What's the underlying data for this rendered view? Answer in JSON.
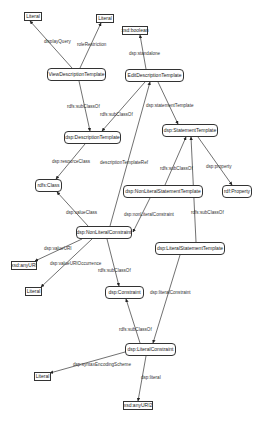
{
  "diagram": {
    "nodes": [
      {
        "id": "literal1",
        "label": "Literal",
        "kind": "literal",
        "x": 24,
        "y": 12,
        "w": 18,
        "h": 9
      },
      {
        "id": "literal2",
        "label": "Literal",
        "kind": "literal",
        "x": 96,
        "y": 14,
        "w": 18,
        "h": 9
      },
      {
        "id": "xsdBoolean",
        "label": "xsd:boolean",
        "kind": "literal",
        "x": 122,
        "y": 26,
        "w": 26,
        "h": 9
      },
      {
        "id": "viewDescTemplate",
        "label": "ViewDescriptionTemplate",
        "kind": "class",
        "x": 47,
        "y": 68,
        "w": 59,
        "h": 13
      },
      {
        "id": "editDescTemplate",
        "label": "EditDescriptionTemplate",
        "kind": "class",
        "x": 125,
        "y": 69,
        "w": 59,
        "h": 13
      },
      {
        "id": "descTemplate",
        "label": "dsp:DescriptionTemplate",
        "kind": "class",
        "x": 64,
        "y": 131,
        "w": 57,
        "h": 13
      },
      {
        "id": "statementTemplate",
        "label": "dsp:StatementTemplate",
        "kind": "class",
        "x": 162,
        "y": 124,
        "w": 56,
        "h": 13
      },
      {
        "id": "rdfsClass",
        "label": "rdfs:Class",
        "kind": "class",
        "x": 35,
        "y": 179,
        "w": 27,
        "h": 13
      },
      {
        "id": "nonLitStmtTemplate",
        "label": "dsp:NonLiteralStatementTemplate",
        "kind": "class",
        "x": 123,
        "y": 185,
        "w": 80,
        "h": 13
      },
      {
        "id": "rdfProperty",
        "label": "rdf:Property",
        "kind": "class",
        "x": 222,
        "y": 185,
        "w": 30,
        "h": 13
      },
      {
        "id": "nonLitConstraint",
        "label": "dsp:NonLiteralConstraint",
        "kind": "class",
        "x": 76,
        "y": 226,
        "w": 56,
        "h": 13
      },
      {
        "id": "litStmtTemplate",
        "label": "dsp:LiteralStatementTemplate",
        "kind": "class",
        "x": 155,
        "y": 242,
        "w": 70,
        "h": 13
      },
      {
        "id": "xsdAnyURI1",
        "label": "xsd:anyURI",
        "kind": "literal",
        "x": 11,
        "y": 261,
        "w": 26,
        "h": 9
      },
      {
        "id": "literal3",
        "label": "Literal",
        "kind": "literal",
        "x": 25,
        "y": 287,
        "w": 17,
        "h": 9
      },
      {
        "id": "constraint",
        "label": "dsp:Constraint",
        "kind": "class",
        "x": 105,
        "y": 286,
        "w": 39,
        "h": 13
      },
      {
        "id": "litConstraint",
        "label": "dsp:LiteralConstraint",
        "kind": "class",
        "x": 125,
        "y": 343,
        "w": 51,
        "h": 13
      },
      {
        "id": "literal4",
        "label": "Literal",
        "kind": "literal",
        "x": 34,
        "y": 372,
        "w": 17,
        "h": 9
      },
      {
        "id": "xsdAnyURI2",
        "label": "xsd:anyURI2",
        "kind": "literal",
        "x": 123,
        "y": 401,
        "w": 30,
        "h": 9
      }
    ],
    "edges": [
      {
        "from": "viewDescTemplate",
        "to": "literal1",
        "label": "displayQuery",
        "x1": 72,
        "y1": 68,
        "x2": 30,
        "y2": 21,
        "lx": 44,
        "ly": 39
      },
      {
        "from": "viewDescTemplate",
        "to": "literal2",
        "label": "roleRestriction",
        "x1": 80,
        "y1": 68,
        "x2": 101,
        "y2": 23,
        "lx": 77,
        "ly": 42
      },
      {
        "from": "editDescTemplate",
        "to": "xsdBoolean",
        "label": "dsp:standalone",
        "x1": 146,
        "y1": 69,
        "x2": 140,
        "y2": 35,
        "lx": 129,
        "ly": 51
      },
      {
        "from": "viewDescTemplate",
        "to": "descTemplate",
        "label": "rdfs:subClassOf",
        "x1": 79,
        "y1": 81,
        "x2": 90,
        "y2": 131,
        "lx": 67,
        "ly": 104
      },
      {
        "from": "editDescTemplate",
        "to": "descTemplate",
        "label": "rdfs:subClassOf",
        "x1": 145,
        "y1": 82,
        "x2": 102,
        "y2": 131,
        "lx": 100,
        "ly": 112
      },
      {
        "from": "editDescTemplate",
        "to": "statementTemplate",
        "label": "dsp:statementTemplate",
        "x1": 158,
        "y1": 82,
        "x2": 178,
        "y2": 124,
        "lx": 146,
        "ly": 103
      },
      {
        "from": "descTemplate",
        "to": "rdfsClass",
        "label": "dsp:resourceClass",
        "x1": 85,
        "y1": 144,
        "x2": 56,
        "y2": 179,
        "lx": 52,
        "ly": 159
      },
      {
        "from": "nonLitConstraint",
        "to": "editDescTemplate",
        "label": "descriptionTemplateRef",
        "x1": 110,
        "y1": 226,
        "x2": 150,
        "y2": 82,
        "lx": 100,
        "ly": 160
      },
      {
        "from": "nonLitStmtTemplate",
        "to": "statementTemplate",
        "label": "rdfs:subClassOf",
        "x1": 165,
        "y1": 185,
        "x2": 186,
        "y2": 137,
        "lx": 160,
        "ly": 166
      },
      {
        "from": "statementTemplate",
        "to": "rdfProperty",
        "label": "dsp:property",
        "x1": 198,
        "y1": 137,
        "x2": 232,
        "y2": 185,
        "lx": 206,
        "ly": 164
      },
      {
        "from": "litStmtTemplate",
        "to": "statementTemplate",
        "label": "rdfs:subClassOf",
        "x1": 196,
        "y1": 242,
        "x2": 191,
        "y2": 137,
        "lx": 191,
        "ly": 210
      },
      {
        "from": "nonLitConstraint",
        "to": "rdfsClass",
        "label": "dsp:valueClass",
        "x1": 88,
        "y1": 226,
        "x2": 57,
        "y2": 192,
        "lx": 66,
        "ly": 210
      },
      {
        "from": "nonLitStmtTemplate",
        "to": "nonLitConstraint",
        "label": "dsp:nonLiteralConstraint",
        "x1": 150,
        "y1": 198,
        "x2": 133,
        "y2": 232,
        "lx": 124,
        "ly": 212
      },
      {
        "from": "nonLitConstraint",
        "to": "xsdAnyURI1",
        "label": "dsp:valueURI",
        "x1": 82,
        "y1": 239,
        "x2": 35,
        "y2": 261,
        "lx": 44,
        "ly": 246
      },
      {
        "from": "nonLitConstraint",
        "to": "literal3",
        "label": "dsp:valueURIOccurrence",
        "x1": 92,
        "y1": 239,
        "x2": 41,
        "y2": 287,
        "lx": 50,
        "ly": 261
      },
      {
        "from": "nonLitConstraint",
        "to": "constraint",
        "label": "rdfs:subClassOf",
        "x1": 107,
        "y1": 239,
        "x2": 119,
        "y2": 286,
        "lx": 98,
        "ly": 268
      },
      {
        "from": "litStmtTemplate",
        "to": "litConstraint",
        "label": "dsp:literalConstraint",
        "x1": 180,
        "y1": 255,
        "x2": 153,
        "y2": 343,
        "lx": 150,
        "ly": 290
      },
      {
        "from": "litConstraint",
        "to": "constraint",
        "label": "rdfs:subClassOf",
        "x1": 140,
        "y1": 343,
        "x2": 126,
        "y2": 299,
        "lx": 119,
        "ly": 327
      },
      {
        "from": "litConstraint",
        "to": "literal4",
        "label": "dsp:syntaxEncodingScheme",
        "x1": 125,
        "y1": 352,
        "x2": 50,
        "y2": 373,
        "lx": 73,
        "ly": 362
      },
      {
        "from": "litConstraint",
        "to": "xsdAnyURI2",
        "label": "dsp:literal",
        "x1": 146,
        "y1": 356,
        "x2": 138,
        "y2": 401,
        "lx": 141,
        "ly": 375
      }
    ]
  },
  "labels": {
    "literal1": "Literal",
    "literal2": "Literal",
    "xsdBoolean": "xsd:boolean",
    "viewDescTemplate": "ViewDescriptionTemplate",
    "editDescTemplate": "EditDescriptionTemplate",
    "descTemplate": "dsp:DescriptionTemplate",
    "statementTemplate": "dsp:StatementTemplate",
    "rdfsClass": "rdfs:Class",
    "nonLitStmtTemplate": "dsp:NonLiteralStatementTemplate",
    "rdfProperty": "rdf:Property",
    "nonLitConstraint": "dsp:NonLiteralConstraint",
    "litStmtTemplate": "dsp:LiteralStatementTemplate",
    "xsdAnyURI1": "xsd:anyURI",
    "literal3": "Literal",
    "constraint": "dsp:Constraint",
    "litConstraint": "dsp:LiteralConstraint",
    "literal4": "Literal",
    "xsdAnyURI2": "xsd:anyURI2"
  }
}
